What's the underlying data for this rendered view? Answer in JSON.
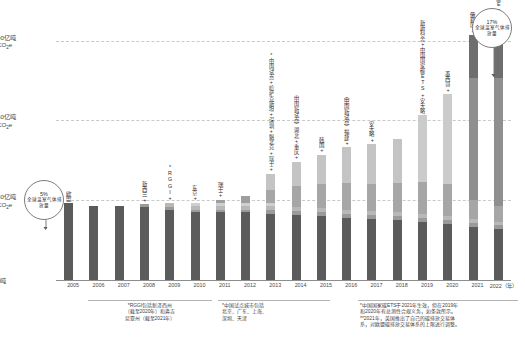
{
  "chart_data": {
    "type": "bar",
    "title": "",
    "subtitle": "",
    "xlabel": "",
    "ylabel": "",
    "ylim": [
      0,
      100
    ],
    "grid": true,
    "legend_position": "none",
    "yticks": [
      {
        "value": 90,
        "label": "90亿吨",
        "unit": "CO₂e"
      },
      {
        "value": 60,
        "label": "60亿吨",
        "unit": "CO₂e"
      },
      {
        "value": 30,
        "label": "30亿吨",
        "unit": "CO₂e"
      },
      {
        "value": 0,
        "label": "0吨",
        "unit": ""
      }
    ],
    "categories": [
      "2005",
      "2006",
      "2007",
      "2008",
      "2009",
      "2010",
      "2011",
      "2012",
      "2013",
      "2014",
      "2015",
      "2016",
      "2017",
      "2018",
      "2019",
      "2020",
      "2021",
      "2022（年）"
    ],
    "totals": [
      29,
      28,
      28,
      28.5,
      29,
      29,
      30,
      31.5,
      40,
      44.5,
      47,
      50,
      51,
      53,
      62,
      70,
      92,
      97
    ],
    "bars": [
      {
        "year": "2005",
        "total": 29,
        "segments": [
          {
            "name": "欧盟",
            "value": 29,
            "color": "#5b5b5b"
          }
        ],
        "annotation": "欧盟"
      },
      {
        "year": "2006",
        "total": 28,
        "segments": [
          {
            "name": "欧盟",
            "value": 28,
            "color": "#5b5b5b"
          }
        ],
        "annotation": ""
      },
      {
        "year": "2007",
        "total": 28,
        "segments": [
          {
            "name": "欧盟",
            "value": 28,
            "color": "#5b5b5b"
          }
        ],
        "annotation": ""
      },
      {
        "year": "2008",
        "total": 28.5,
        "segments": [
          {
            "name": "欧盟",
            "value": 27.5,
            "color": "#5b5b5b"
          },
          {
            "name": "新西兰",
            "value": 1,
            "color": "#9a9a9a"
          }
        ],
        "annotation": "新西兰+"
      },
      {
        "year": "2009",
        "total": 29,
        "segments": [
          {
            "name": "欧盟",
            "value": 26.5,
            "color": "#5b5b5b"
          },
          {
            "name": "新西兰",
            "value": 1,
            "color": "#9a9a9a"
          },
          {
            "name": "RGGI",
            "value": 1.5,
            "color": "#b8b8b8"
          }
        ],
        "annotation": "*RGGI+"
      },
      {
        "year": "2010",
        "total": 29,
        "segments": [
          {
            "name": "欧盟",
            "value": 25.5,
            "color": "#5b5b5b"
          },
          {
            "name": "新西兰",
            "value": 1,
            "color": "#9a9a9a"
          },
          {
            "name": "RGGI",
            "value": 1.5,
            "color": "#b8b8b8"
          },
          {
            "name": "东京",
            "value": 1,
            "color": "#cfcfcf"
          }
        ],
        "annotation": "东京+"
      },
      {
        "year": "2011",
        "total": 30,
        "segments": [
          {
            "name": "欧盟",
            "value": 25.5,
            "color": "#5b5b5b"
          },
          {
            "name": "新西兰",
            "value": 1,
            "color": "#9a9a9a"
          },
          {
            "name": "RGGI",
            "value": 1.5,
            "color": "#b8b8b8"
          },
          {
            "name": "东京",
            "value": 1,
            "color": "#cfcfcf"
          },
          {
            "name": "瑞士",
            "value": 1,
            "color": "#9e9e9e"
          }
        ],
        "annotation": "瑞士+"
      },
      {
        "year": "2012",
        "total": 31.5,
        "segments": [
          {
            "name": "欧盟",
            "value": 25.5,
            "color": "#5b5b5b"
          },
          {
            "name": "新西兰",
            "value": 1,
            "color": "#9a9a9a"
          },
          {
            "name": "RGGI",
            "value": 1.5,
            "color": "#b8b8b8"
          },
          {
            "name": "东京",
            "value": 1,
            "color": "#cfcfcf"
          },
          {
            "name": "瑞士",
            "value": 2.5,
            "color": "#9e9e9e"
          }
        ],
        "annotation": ""
      },
      {
        "year": "2013",
        "total": 40,
        "segments": [
          {
            "name": "欧盟",
            "value": 25,
            "color": "#5b5b5b"
          },
          {
            "name": "新西兰",
            "value": 1.5,
            "color": "#9a9a9a"
          },
          {
            "name": "RGGI",
            "value": 1.5,
            "color": "#b8b8b8"
          },
          {
            "name": "东京",
            "value": 1,
            "color": "#cfcfcf"
          },
          {
            "name": "中国试点",
            "value": 5,
            "color": "#a6a6a6"
          },
          {
            "name": "加州+魁北克",
            "value": 6,
            "color": "#c4c4c4"
          }
        ],
        "annotation": "*中国试点+哈萨克斯坦+深圳+魁北克+瑞士+"
      },
      {
        "year": "2014",
        "total": 44.5,
        "segments": [
          {
            "name": "欧盟",
            "value": 24.5,
            "color": "#5b5b5b"
          },
          {
            "name": "新西兰",
            "value": 1.5,
            "color": "#9a9a9a"
          },
          {
            "name": "RGGI",
            "value": 1.5,
            "color": "#b8b8b8"
          },
          {
            "name": "中国试点",
            "value": 8,
            "color": "#a6a6a6"
          },
          {
            "name": "湖北+重庆",
            "value": 9,
            "color": "#c4c4c4"
          }
        ],
        "annotation": "（中国新试点）湖北+重庆+"
      },
      {
        "year": "2015",
        "total": 47,
        "segments": [
          {
            "name": "欧盟",
            "value": 24,
            "color": "#5b5b5b"
          },
          {
            "name": "新西兰",
            "value": 1.5,
            "color": "#9a9a9a"
          },
          {
            "name": "RGGI",
            "value": 1.5,
            "color": "#b8b8b8"
          },
          {
            "name": "中国试点",
            "value": 9,
            "color": "#a6a6a6"
          },
          {
            "name": "韩国",
            "value": 11,
            "color": "#c4c4c4"
          }
        ],
        "annotation": "韩国+"
      },
      {
        "year": "2016",
        "total": 50,
        "segments": [
          {
            "name": "欧盟",
            "value": 23.5,
            "color": "#5b5b5b"
          },
          {
            "name": "新西兰",
            "value": 1.5,
            "color": "#9a9a9a"
          },
          {
            "name": "RGGI",
            "value": 1.5,
            "color": "#b8b8b8"
          },
          {
            "name": "中国试点",
            "value": 10,
            "color": "#a6a6a6"
          },
          {
            "name": "福建",
            "value": 13.5,
            "color": "#c4c4c4"
          }
        ],
        "annotation": "（中国新试点）福建+"
      },
      {
        "year": "2017",
        "total": 51,
        "segments": [
          {
            "name": "欧盟",
            "value": 23,
            "color": "#5b5b5b"
          },
          {
            "name": "新西兰",
            "value": 1.5,
            "color": "#9a9a9a"
          },
          {
            "name": "RGGI",
            "value": 1.5,
            "color": "#b8b8b8"
          },
          {
            "name": "中国试点",
            "value": 10,
            "color": "#a6a6a6"
          },
          {
            "name": "安大略",
            "value": 15,
            "color": "#c4c4c4"
          }
        ],
        "annotation": "安大略+"
      },
      {
        "year": "2018",
        "total": 53,
        "segments": [
          {
            "name": "欧盟",
            "value": 22.5,
            "color": "#5b5b5b"
          },
          {
            "name": "新西兰",
            "value": 1.5,
            "color": "#9a9a9a"
          },
          {
            "name": "RGGI",
            "value": 1.5,
            "color": "#b8b8b8"
          },
          {
            "name": "中国试点",
            "value": 11,
            "color": "#a6a6a6"
          },
          {
            "name": "其他",
            "value": 16.5,
            "color": "#c4c4c4"
          }
        ],
        "annotation": ""
      },
      {
        "year": "2019",
        "total": 62,
        "segments": [
          {
            "name": "欧盟",
            "value": 22,
            "color": "#5b5b5b"
          },
          {
            "name": "新西兰",
            "value": 1.5,
            "color": "#9a9a9a"
          },
          {
            "name": "RGGI",
            "value": 1.5,
            "color": "#b8b8b8"
          },
          {
            "name": "中国试点",
            "value": 12,
            "color": "#a6a6a6"
          },
          {
            "name": "新斯科舍",
            "value": 25,
            "color": "#cbcbcb"
          }
        ],
        "annotation": "新斯科舍+中国国家碳ETS+安大略"
      },
      {
        "year": "2020",
        "total": 70,
        "segments": [
          {
            "name": "欧盟",
            "value": 21,
            "color": "#5b5b5b"
          },
          {
            "name": "新西兰",
            "value": 1.5,
            "color": "#9a9a9a"
          },
          {
            "name": "RGGI",
            "value": 1.5,
            "color": "#b8b8b8"
          },
          {
            "name": "中国试点",
            "value": 12,
            "color": "#a6a6a6"
          },
          {
            "name": "墨西哥",
            "value": 34,
            "color": "#cbcbcb"
          }
        ],
        "annotation": "墨西哥+"
      },
      {
        "year": "2021",
        "total": 92,
        "segments": [
          {
            "name": "欧盟",
            "value": 20,
            "color": "#5b5b5b"
          },
          {
            "name": "新西兰",
            "value": 1.5,
            "color": "#9a9a9a"
          },
          {
            "name": "RGGI",
            "value": 1.5,
            "color": "#b8b8b8"
          },
          {
            "name": "中国试点",
            "value": 7,
            "color": "#a6a6a6"
          },
          {
            "name": "中国国家ETS",
            "value": 46,
            "color": "#8f8f8f"
          },
          {
            "name": "俄勒冈",
            "value": 16,
            "color": "#6e6e6e"
          }
        ],
        "annotation": "俄勒冈+"
      },
      {
        "year": "2022（年）",
        "total": 97,
        "segments": [
          {
            "name": "欧盟",
            "value": 19,
            "color": "#5b5b5b"
          },
          {
            "name": "新西兰",
            "value": 1.5,
            "color": "#9a9a9a"
          },
          {
            "name": "RGGI",
            "value": 1.5,
            "color": "#b8b8b8"
          },
          {
            "name": "中国试点",
            "value": 6,
            "color": "#a6a6a6"
          },
          {
            "name": "中国国家ETS",
            "value": 48,
            "color": "#8f8f8f"
          },
          {
            "name": "美国+德国",
            "value": 21,
            "color": "#6e6e6e"
          }
        ],
        "annotation": "*美国+德国+中国国家碳ETS"
      }
    ],
    "annotations": [
      {
        "id": "left-bubble",
        "pct": "5%",
        "text": "全球温室气体排放量",
        "points_to": "2005"
      },
      {
        "id": "right-bubble",
        "pct": "17%",
        "text": "全球温室气体排放量",
        "points_to": "2022（年）"
      }
    ]
  },
  "footnotes": [
    {
      "id": "fn-rggi",
      "lines": [
        "*RGGI包括新泽西州",
        "（截至2020年）和弗吉",
        "尼亚州（截至2021年）"
      ]
    },
    {
      "id": "fn-china-pilot",
      "lines": [
        "*中国试点城市包括",
        "北京、广东、上海、",
        "深圳、天津"
      ]
    },
    {
      "id": "fn-national-ets",
      "lines": [
        "*中国国家碳ETS于2021年生效，但在2019年",
        "和2020年有总测性合规义务，如条款所示。",
        "**2021年，英国推出了自己的碳排放交易体",
        "系，对欧盟碳排放交易体系的上限进行调整。"
      ]
    }
  ]
}
